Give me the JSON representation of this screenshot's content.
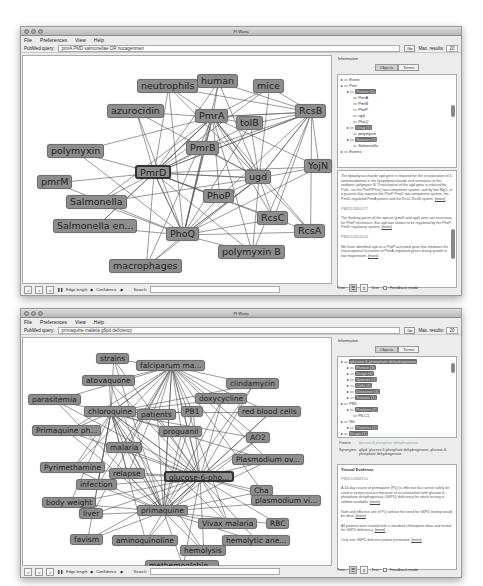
{
  "windows": [
    {
      "title": "PI Wana",
      "menu": [
        "File",
        "Preferences",
        "View",
        "Help"
      ],
      "query": {
        "label": "PubMed query:",
        "value": "pmrA PMD salmonellae OR nocagenmeri",
        "go": "Go",
        "max_label": "Max. results:",
        "max_value": "20"
      },
      "graph": {
        "nodes": [
          {
            "id": "human",
            "label": "human",
            "x": 174,
            "y": 18
          },
          {
            "id": "neutrophils",
            "label": "neutrophils",
            "x": 114,
            "y": 23
          },
          {
            "id": "mice",
            "label": "mice",
            "x": 230,
            "y": 23
          },
          {
            "id": "azurocidin",
            "label": "azurocidin",
            "x": 84,
            "y": 48
          },
          {
            "id": "PmrA",
            "label": "PmrA",
            "x": 172,
            "y": 53
          },
          {
            "id": "tolB",
            "label": "tolB",
            "x": 213,
            "y": 60
          },
          {
            "id": "RcsB",
            "label": "RcsB",
            "x": 272,
            "y": 48
          },
          {
            "id": "polymyxin",
            "label": "polymyxin",
            "x": 24,
            "y": 88
          },
          {
            "id": "PmrB",
            "label": "PmrB",
            "x": 163,
            "y": 85
          },
          {
            "id": "PmrD",
            "label": "PmrD",
            "x": 112,
            "y": 109,
            "selected": true
          },
          {
            "id": "YojN",
            "label": "YojN",
            "x": 281,
            "y": 103
          },
          {
            "id": "ugd",
            "label": "ugd",
            "x": 222,
            "y": 114
          },
          {
            "id": "pmrM",
            "label": "pmrM",
            "x": 14,
            "y": 119
          },
          {
            "id": "PhoP",
            "label": "PhoP",
            "x": 180,
            "y": 133
          },
          {
            "id": "Salmonella",
            "label": "Salmonella",
            "x": 43,
            "y": 139
          },
          {
            "id": "RcsC",
            "label": "RcsC",
            "x": 234,
            "y": 155
          },
          {
            "id": "Salmonella_en",
            "label": "Salmonella en...",
            "x": 30,
            "y": 163
          },
          {
            "id": "RcsA",
            "label": "RcsA",
            "x": 271,
            "y": 168
          },
          {
            "id": "PhoQ",
            "label": "PhoQ",
            "x": 143,
            "y": 171
          },
          {
            "id": "polymyxin_B",
            "label": "polymyxin B",
            "x": 195,
            "y": 189
          },
          {
            "id": "macrophages",
            "label": "macrophages",
            "x": 86,
            "y": 203
          }
        ]
      },
      "toolbar": {
        "edge_length": "Edge length",
        "confidence": "Confidence",
        "search": "Search:"
      },
      "info": {
        "label": "Information",
        "tabs": [
          "Objects",
          "Terms"
        ],
        "active_tab": "Objects",
        "tree": [
          {
            "indent": 0,
            "text": "Event"
          },
          {
            "indent": 0,
            "text": "Prot"
          },
          {
            "indent": 1,
            "text": "Protein (5)",
            "hl": true
          },
          {
            "indent": 2,
            "text": "PmrA"
          },
          {
            "indent": 2,
            "text": "PmrB"
          },
          {
            "indent": 2,
            "text": "PhoP"
          },
          {
            "indent": 2,
            "text": "ugd"
          },
          {
            "indent": 2,
            "text": "PhoQ"
          },
          {
            "indent": 1,
            "text": "Drug (1)",
            "hl": true
          },
          {
            "indent": 2,
            "text": "polymyxin"
          },
          {
            "indent": 1,
            "text": "Species (1)",
            "hl": true
          },
          {
            "indent": 2,
            "text": "Salmonella"
          },
          {
            "indent": 0,
            "text": "Events"
          }
        ],
        "evidence": [
          {
            "pmid": "",
            "text": "The lipopolysaccharide ugd gene is required for the incorporation of 4-aminoarabinose in the lipopolysaccharide and resistance to the antibiotic polymyxin B. Transcription of the ugd gene is induced by PoS-, via the PhoP/PhoQ two-component system, and by low Mg2+ in a process that requires the PhoP-PmrD two-component system, the PmrD-regulated PmrA protein and the RcsC-RcsB system.",
            "cite": "[more]"
          },
          {
            "pmid": "PMID11830577",
            "text": "The flanking genes of the operon (pmrD and ugd) were not necessary for PhoP resistance. But ugd was shown to be regulated by the PhoP-PmrD regulatory system.",
            "cite": "[more]"
          },
          {
            "pmid": "PMID11819203",
            "text": "We have identified ugd as a PhoP-activated gene that mediates the transcriptional activation of PmrA-regulated genes during growth in low magnesium.",
            "cite": "[more]"
          }
        ],
        "bottom": {
          "tree_label": "Tree:",
          "text_label": "Text:",
          "feedback_label": "Feedback mode"
        }
      }
    },
    {
      "title": "PI Wana",
      "menu": [
        "File",
        "Preferences",
        "View",
        "Help"
      ],
      "query": {
        "label": "PubMed query:",
        "value": "primaquine malaria g6pd deficiency",
        "go": "Go",
        "max_label": "Max. results:",
        "max_value": "20"
      },
      "graph": {
        "nodes": [
          {
            "id": "strains",
            "label": "strains",
            "x": 73,
            "y": 15
          },
          {
            "id": "falciparum",
            "label": "falciparum ma...",
            "x": 113,
            "y": 22
          },
          {
            "id": "atovaquone",
            "label": "atovaquone",
            "x": 59,
            "y": 37
          },
          {
            "id": "clindamycin",
            "label": "clindamycin",
            "x": 203,
            "y": 40
          },
          {
            "id": "parasitemia",
            "label": "parasitemia",
            "x": 5,
            "y": 56
          },
          {
            "id": "doxycycline",
            "label": "doxycycline",
            "x": 172,
            "y": 55
          },
          {
            "id": "chloroquine",
            "label": "chloroquine",
            "x": 61,
            "y": 68
          },
          {
            "id": "patients",
            "label": "patients",
            "x": 114,
            "y": 71
          },
          {
            "id": "PB1",
            "label": "PB1",
            "x": 158,
            "y": 68
          },
          {
            "id": "red_blood_cells",
            "label": "red blood cells",
            "x": 215,
            "y": 68
          },
          {
            "id": "primaquine_ph",
            "label": "Primaquine ph...",
            "x": 9,
            "y": 87
          },
          {
            "id": "proguanil",
            "label": "proguanil",
            "x": 136,
            "y": 88
          },
          {
            "id": "AO2",
            "label": "AO2",
            "x": 223,
            "y": 94
          },
          {
            "id": "malaria",
            "label": "malaria",
            "x": 83,
            "y": 104
          },
          {
            "id": "plasmodium_ov",
            "label": "Plasmodium ov...",
            "x": 209,
            "y": 116
          },
          {
            "id": "pyrimethamine",
            "label": "Pyrimethamine",
            "x": 17,
            "y": 124
          },
          {
            "id": "relapse",
            "label": "relapse",
            "x": 86,
            "y": 130
          },
          {
            "id": "g6pd",
            "label": "glucose-6-pho...",
            "x": 141,
            "y": 133,
            "selected": true
          },
          {
            "id": "infection",
            "label": "infection",
            "x": 53,
            "y": 141
          },
          {
            "id": "Cha",
            "label": "Cha",
            "x": 227,
            "y": 147
          },
          {
            "id": "plasmodium_vi",
            "label": "plasmodium vi...",
            "x": 228,
            "y": 157
          },
          {
            "id": "body_weight",
            "label": "body weight",
            "x": 19,
            "y": 159
          },
          {
            "id": "liver",
            "label": "liver",
            "x": 56,
            "y": 170
          },
          {
            "id": "primaquine",
            "label": "primaquine",
            "x": 114,
            "y": 167
          },
          {
            "id": "vivax",
            "label": "Vivax malaria",
            "x": 175,
            "y": 180
          },
          {
            "id": "RBC",
            "label": "RBC",
            "x": 243,
            "y": 180
          },
          {
            "id": "favism",
            "label": "favism",
            "x": 47,
            "y": 196
          },
          {
            "id": "aminoquinoline",
            "label": "aminoquinoline",
            "x": 89,
            "y": 197
          },
          {
            "id": "hemolytic",
            "label": "hemolytic ane...",
            "x": 199,
            "y": 197
          },
          {
            "id": "hemolysis",
            "label": "hemolysis",
            "x": 157,
            "y": 207
          },
          {
            "id": "methemoglobin",
            "label": "methemoglobin...",
            "x": 122,
            "y": 222
          }
        ]
      },
      "toolbar": {
        "edge_length": "Edge length",
        "confidence": "Confidence",
        "search": "Search:"
      },
      "info": {
        "label": "Information",
        "tabs": [
          "Objects",
          "Terms"
        ],
        "active_tab": "Objects",
        "tree": [
          {
            "indent": 0,
            "text": "glucose-6-phosphate dehydrogenase",
            "hl": true
          },
          {
            "indent": 1,
            "text": "Protein (3)",
            "hl": true
          },
          {
            "indent": 1,
            "text": "Drugs (4)",
            "hl": true
          },
          {
            "indent": 1,
            "text": "Species (1)",
            "hl": true
          },
          {
            "indent": 1,
            "text": "Cells (1)",
            "hl": true
          },
          {
            "indent": 1,
            "text": "Diseases (4)",
            "hl": true
          },
          {
            "indent": 1,
            "text": "Tissues (1)",
            "hl": true
          },
          {
            "indent": 0,
            "text": "PB1"
          },
          {
            "indent": 1,
            "text": "Proteins (2)",
            "hl": true
          },
          {
            "indent": 2,
            "text": "PfLC1"
          },
          {
            "indent": 0,
            "text": "Rfc"
          },
          {
            "indent": 1,
            "text": "Proteins (1)",
            "hl": true
          },
          {
            "indent": 0,
            "text": "Drugs (1)",
            "hl": true
          }
        ],
        "details": {
          "protein_label": "Protein:",
          "protein_value": "glucose-6-phosphate dehydrogenase",
          "synonyms_label": "Synonyms:",
          "synonyms_value": "g6pd, glucose-6-phosphate dehydrogenase, glucose-6-phosphate dehydrogenase"
        },
        "section_title": "Textual Evidence",
        "evidence": [
          {
            "pmid": "PMID11868150",
            "text": "A 14-day course of primaquine (PQ) is effective but cannot safely be used in routine practice because of its association with glucose-6-phosphate dehydrogenase (G6PD) deficiency for which testing is seldom available.",
            "cite": "[more]"
          },
          {
            "pmid": "",
            "text": "Safe and effective use of PQ without the need for G6PD testing would be ideal.",
            "cite": "[more]"
          },
          {
            "pmid": "",
            "text": "All patients were treated with a standard chloroquine dose and tested for G6PD deficiency.",
            "cite": "[more]"
          },
          {
            "pmid": "",
            "text": "Only one G6PD deficient patient presented.",
            "cite": "[more]"
          }
        ],
        "bottom": {
          "tree_label": "Tree:",
          "text_label": "Text:",
          "feedback_label": "Feedback mode"
        }
      }
    }
  ],
  "colors": {
    "node_fill": "#8d8d8d",
    "node_border": "#6f6f6f",
    "edge": "#555555",
    "window_bg": "#ececec"
  }
}
